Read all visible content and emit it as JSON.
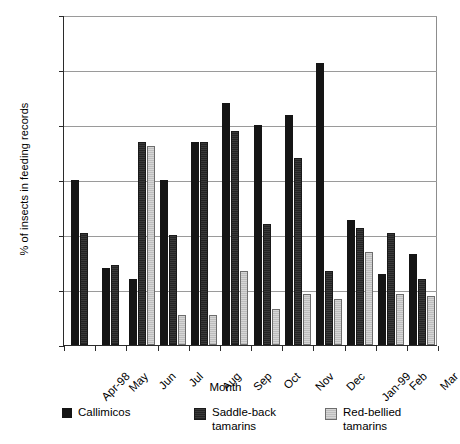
{
  "chart_data": {
    "type": "bar",
    "title": "",
    "xlabel": "Month",
    "ylabel": "% of insects in feeding records",
    "categories": [
      "Apr-98",
      "May",
      "Jun",
      "Jul",
      "Aug",
      "Sep",
      "Oct",
      "Nov",
      "Dec",
      "Jan-99",
      "Feb",
      "Mar"
    ],
    "series": [
      {
        "name": "Callimicos",
        "color": "#151515",
        "values": [
          30,
          14,
          12,
          30,
          37,
          44,
          40,
          41.8,
          51.3,
          22.8,
          13,
          16.5
        ]
      },
      {
        "name": "Saddle-back tamarins",
        "color": "#2e2e2e",
        "values": [
          20.3,
          14.5,
          37,
          20,
          37,
          39,
          22,
          34,
          13.5,
          21.2,
          20.4,
          12
        ]
      },
      {
        "name": "Red-bellied tamarins",
        "color": "#c9c9c9",
        "values": [
          null,
          null,
          36.2,
          5.5,
          5.5,
          13.5,
          6.5,
          9.3,
          8.3,
          17,
          9.2,
          9
        ]
      }
    ],
    "ylim": [
      0,
      60
    ],
    "yticks": [
      0,
      10,
      20,
      30,
      40,
      50,
      60
    ],
    "grid": true,
    "legend_position": "bottom"
  },
  "legend": {
    "items": [
      {
        "label": "Callimicos"
      },
      {
        "label": "Saddle-back\ntamarins"
      },
      {
        "label": "Red-bellied\ntamarins"
      }
    ]
  }
}
